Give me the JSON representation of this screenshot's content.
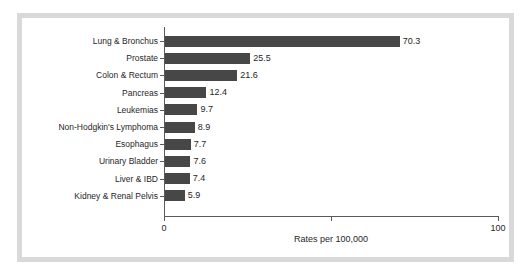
{
  "chart_data": {
    "type": "bar",
    "orientation": "horizontal",
    "title": "",
    "xlabel": "Rates per 100,000",
    "ylabel": "",
    "xlim": [
      0,
      100
    ],
    "grid": false,
    "legend": null,
    "x_tick_labels": [
      "0",
      "100"
    ],
    "x_tick_values": [
      0,
      100
    ],
    "x_minor_tick_values": [
      50
    ],
    "categories": [
      "Lung & Bronchus",
      "Prostate",
      "Colon & Rectum",
      "Pancreas",
      "Leukemias",
      "Non-Hodgkin's Lymphoma",
      "Esophagus",
      "Urinary Bladder",
      "Liver & IBD",
      "Kidney & Renal Pelvis"
    ],
    "values": [
      70.3,
      25.5,
      21.6,
      12.4,
      9.7,
      8.9,
      7.7,
      7.6,
      7.4,
      5.9
    ],
    "value_labels": [
      "70.3",
      "25.5",
      "21.6",
      "12.4",
      "9.7",
      "8.9",
      "7.7",
      "7.6",
      "7.4",
      "5.9"
    ],
    "bar_color": "#474747",
    "axis_color": "#5a5a5a",
    "text_color": "#1f1f1f",
    "frame_color": "#d9d9d9",
    "background_color": "#ffffff"
  }
}
